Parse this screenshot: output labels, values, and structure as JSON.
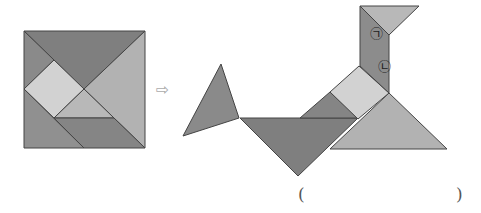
{
  "figure": {
    "left_square": {
      "label": "tangram-square",
      "pieces": [
        {
          "name": "large-triangle-top",
          "points": "24,31 145,31 84,89",
          "fill": "#7f7f7f"
        },
        {
          "name": "large-triangle-right",
          "points": "145,31 145,148 84,89",
          "fill": "#b2b2b2"
        },
        {
          "name": "small-triangle-left",
          "points": "24,31 54,60 24,89",
          "fill": "#8a8a8a"
        },
        {
          "name": "square",
          "points": "54,60 84,89 54,118 24,89",
          "fill": "#d2d2d2"
        },
        {
          "name": "small-triangle-middle",
          "points": "84,89 114,118 54,118",
          "fill": "#b8b8b8"
        },
        {
          "name": "parallelogram",
          "points": "54,118 114,118 145,148 84,148",
          "fill": "#858585"
        },
        {
          "name": "medium-triangle-bottom-left",
          "points": "24,89 84,148 24,148",
          "fill": "#909090"
        }
      ]
    },
    "arrow": {
      "symbol": "⇨"
    },
    "right_figure": {
      "label": "tangram-bird",
      "pieces": [
        {
          "name": "tail-triangle",
          "points": "221,64 183,136 239,118",
          "fill": "#8a8a8a"
        },
        {
          "name": "body-large-triangle",
          "points": "240,118 358,118 298,176",
          "fill": "#7f7f7f"
        },
        {
          "name": "small-triangle-back",
          "points": "300,118 330,92 358,118",
          "fill": "#858585"
        },
        {
          "name": "large-triangle-breast",
          "points": "389,93 447,149 330,149",
          "fill": "#b2b2b2"
        },
        {
          "name": "square",
          "points": "330,92 359,66 389,93 358,119",
          "fill": "#d2d2d2"
        },
        {
          "name": "neck-parallelogram",
          "points": "360,6 389,35 389,93 360,66",
          "fill": "#8c8c8c"
        },
        {
          "name": "head-triangle",
          "points": "360,6 419,6 389,35",
          "fill": "#b8b8b8"
        }
      ],
      "labels": [
        {
          "id": "label-giyeok",
          "text": "㉠",
          "x": 370,
          "y": 38
        },
        {
          "id": "label-nieun",
          "text": "㉡",
          "x": 378,
          "y": 71
        }
      ]
    },
    "answer_blank": {
      "open": "(",
      "close": ")"
    }
  }
}
